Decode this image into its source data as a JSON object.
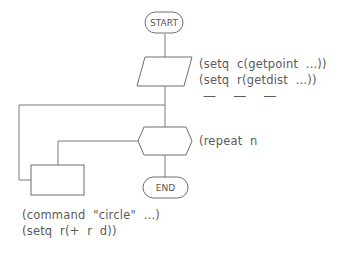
{
  "flowchart": {
    "nodes": {
      "start": {
        "label": "START",
        "shape": "terminator"
      },
      "input": {
        "label": "",
        "shape": "parallelogram"
      },
      "loop": {
        "label": "",
        "shape": "hexagon"
      },
      "process": {
        "label": "",
        "shape": "rectangle"
      },
      "end": {
        "label": "END",
        "shape": "terminator"
      }
    },
    "annotations": {
      "input_lines": [
        "(setq  c(getpoint  ...))",
        "(setq  r(getdist  ...))",
        "—  —  —"
      ],
      "loop_line": "(repeat  n",
      "process_lines": [
        "(command  \"circle\"  ...)",
        "(setq  r(+  r  d))"
      ]
    },
    "colors": {
      "stroke": "#6e6e6e",
      "text": "#5a5a5a",
      "background": "#ffffff"
    }
  }
}
